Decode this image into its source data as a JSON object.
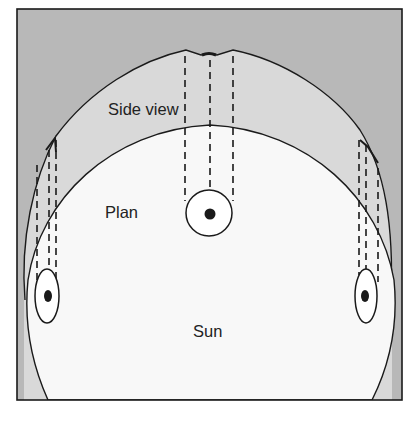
{
  "diagram": {
    "labels": {
      "side_view": "Side view",
      "plan": "Plan",
      "sun": "Sun"
    },
    "colors": {
      "background": "#ffffff",
      "frame_fill": "#b8b8b8",
      "side_view_fill": "#d9d9d9",
      "plan_fill": "#f8f8f8",
      "stroke": "#1a1a1a"
    },
    "elements": [
      {
        "name": "frame",
        "kind": "rectangle"
      },
      {
        "name": "side-view-region",
        "kind": "circle-outline",
        "label_key": "side_view"
      },
      {
        "name": "plan-region",
        "kind": "circle-outline",
        "label_key": "plan"
      },
      {
        "name": "sun-label",
        "kind": "text",
        "label_key": "sun"
      },
      {
        "name": "center-body",
        "kind": "ring-with-dot"
      },
      {
        "name": "left-body",
        "kind": "ellipse-with-dot"
      },
      {
        "name": "right-body",
        "kind": "ellipse-with-dot"
      },
      {
        "name": "projection-lines-center",
        "kind": "dashed-lines",
        "count": 3
      },
      {
        "name": "projection-lines-left",
        "kind": "dashed-lines",
        "count": 3
      },
      {
        "name": "projection-lines-right",
        "kind": "dashed-lines",
        "count": 3
      }
    ]
  }
}
